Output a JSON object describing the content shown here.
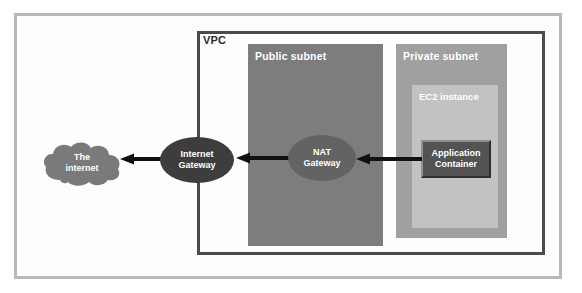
{
  "diagram": {
    "outer_frame": {
      "name": "diagram-frame"
    },
    "vpc": {
      "label": "VPC",
      "border_color": "#4b4b4b"
    },
    "subnets": [
      {
        "id": "public",
        "label": "Public subnet",
        "fill": "#7d7d7d"
      },
      {
        "id": "private",
        "label": "Private subnet",
        "fill": "#a0a0a0"
      }
    ],
    "ec2": {
      "label": "EC2 instance",
      "fill": "#c2c2c2"
    },
    "app_container": {
      "label_line1": "Application",
      "label_line2": "Container",
      "fill": "#535353"
    },
    "gateways": [
      {
        "id": "internet-gateway",
        "label_line1": "Internet",
        "label_line2": "Gateway",
        "fill": "#3d3d3d"
      },
      {
        "id": "nat-gateway",
        "label_line1": "NAT",
        "label_line2": "Gateway",
        "fill": "#636363"
      }
    ],
    "cloud": {
      "label_line1": "The",
      "label_line2": "internet",
      "fill": "#7a7a7a"
    },
    "arrows": [
      {
        "id": "igw-to-internet",
        "from": "Internet Gateway",
        "to": "The internet",
        "direction": "left"
      },
      {
        "id": "nat-to-igw",
        "from": "NAT Gateway",
        "to": "Internet Gateway",
        "direction": "left"
      },
      {
        "id": "app-to-nat",
        "from": "Application Container",
        "to": "NAT Gateway",
        "direction": "left"
      }
    ]
  }
}
